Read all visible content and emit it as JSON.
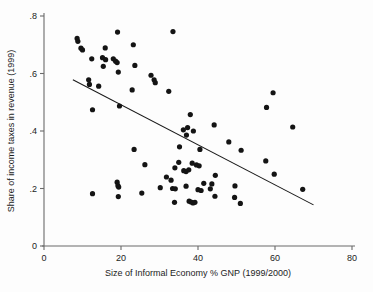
{
  "chart_data": {
    "type": "scatter",
    "title": "",
    "xlabel": "Size of Informal Economy % GNP (1999/2000)",
    "ylabel": "Share of income taxes in revenue (1999)",
    "xlim": [
      0,
      80
    ],
    "ylim": [
      0,
      0.8
    ],
    "xticks": [
      0,
      20,
      40,
      60,
      80
    ],
    "xticklabels": [
      "0",
      "20",
      "40",
      "60",
      "80"
    ],
    "yticks": [
      0,
      0.2,
      0.4,
      0.6,
      0.8
    ],
    "yticklabels": [
      "0",
      ".2",
      ".4",
      ".6",
      ".8"
    ],
    "grid": false,
    "legend": null,
    "marker": "filled-circle",
    "marker_color": "#141414",
    "axis_color": "#6b6b6b",
    "points": [
      {
        "x": 8.6,
        "y": 0.722
      },
      {
        "x": 8.8,
        "y": 0.712
      },
      {
        "x": 9.6,
        "y": 0.688
      },
      {
        "x": 10.0,
        "y": 0.682
      },
      {
        "x": 12.4,
        "y": 0.651
      },
      {
        "x": 15.9,
        "y": 0.689
      },
      {
        "x": 19.1,
        "y": 0.744
      },
      {
        "x": 15.2,
        "y": 0.655
      },
      {
        "x": 16.0,
        "y": 0.648
      },
      {
        "x": 15.4,
        "y": 0.625
      },
      {
        "x": 18.0,
        "y": 0.651
      },
      {
        "x": 18.6,
        "y": 0.643
      },
      {
        "x": 19.0,
        "y": 0.638
      },
      {
        "x": 19.3,
        "y": 0.605
      },
      {
        "x": 23.2,
        "y": 0.7
      },
      {
        "x": 23.6,
        "y": 0.628
      },
      {
        "x": 33.5,
        "y": 0.746
      },
      {
        "x": 27.8,
        "y": 0.594
      },
      {
        "x": 28.6,
        "y": 0.578
      },
      {
        "x": 28.9,
        "y": 0.568
      },
      {
        "x": 11.6,
        "y": 0.578
      },
      {
        "x": 11.8,
        "y": 0.562
      },
      {
        "x": 14.2,
        "y": 0.556
      },
      {
        "x": 22.9,
        "y": 0.543
      },
      {
        "x": 32.4,
        "y": 0.538
      },
      {
        "x": 12.6,
        "y": 0.474
      },
      {
        "x": 19.6,
        "y": 0.487
      },
      {
        "x": 57.8,
        "y": 0.482
      },
      {
        "x": 59.5,
        "y": 0.533
      },
      {
        "x": 64.6,
        "y": 0.414
      },
      {
        "x": 38.0,
        "y": 0.457
      },
      {
        "x": 44.2,
        "y": 0.421
      },
      {
        "x": 36.2,
        "y": 0.404
      },
      {
        "x": 37.3,
        "y": 0.412
      },
      {
        "x": 37.0,
        "y": 0.386
      },
      {
        "x": 38.8,
        "y": 0.4
      },
      {
        "x": 35.2,
        "y": 0.345
      },
      {
        "x": 40.5,
        "y": 0.336
      },
      {
        "x": 48.0,
        "y": 0.362
      },
      {
        "x": 51.2,
        "y": 0.333
      },
      {
        "x": 23.4,
        "y": 0.336
      },
      {
        "x": 26.2,
        "y": 0.283
      },
      {
        "x": 57.6,
        "y": 0.296
      },
      {
        "x": 59.8,
        "y": 0.25
      },
      {
        "x": 34.0,
        "y": 0.272
      },
      {
        "x": 35.0,
        "y": 0.291
      },
      {
        "x": 36.3,
        "y": 0.262
      },
      {
        "x": 36.9,
        "y": 0.259
      },
      {
        "x": 37.6,
        "y": 0.265
      },
      {
        "x": 38.5,
        "y": 0.288
      },
      {
        "x": 39.6,
        "y": 0.282
      },
      {
        "x": 40.3,
        "y": 0.279
      },
      {
        "x": 33.0,
        "y": 0.229
      },
      {
        "x": 33.4,
        "y": 0.2
      },
      {
        "x": 34.1,
        "y": 0.199
      },
      {
        "x": 31.8,
        "y": 0.24
      },
      {
        "x": 36.9,
        "y": 0.208
      },
      {
        "x": 40.0,
        "y": 0.196
      },
      {
        "x": 40.8,
        "y": 0.193
      },
      {
        "x": 41.5,
        "y": 0.218
      },
      {
        "x": 44.5,
        "y": 0.246
      },
      {
        "x": 43.6,
        "y": 0.216
      },
      {
        "x": 49.6,
        "y": 0.209
      },
      {
        "x": 19.0,
        "y": 0.222
      },
      {
        "x": 19.2,
        "y": 0.21
      },
      {
        "x": 19.4,
        "y": 0.205
      },
      {
        "x": 12.6,
        "y": 0.182
      },
      {
        "x": 19.3,
        "y": 0.172
      },
      {
        "x": 25.4,
        "y": 0.184
      },
      {
        "x": 33.9,
        "y": 0.152
      },
      {
        "x": 37.7,
        "y": 0.156
      },
      {
        "x": 38.2,
        "y": 0.153
      },
      {
        "x": 38.7,
        "y": 0.15
      },
      {
        "x": 39.2,
        "y": 0.152
      },
      {
        "x": 44.4,
        "y": 0.173
      },
      {
        "x": 49.5,
        "y": 0.169
      },
      {
        "x": 51.0,
        "y": 0.148
      },
      {
        "x": 67.2,
        "y": 0.197
      },
      {
        "x": 30.2,
        "y": 0.203
      },
      {
        "x": 43.2,
        "y": 0.199
      }
    ],
    "fit_line": {
      "x_start": 7.5,
      "y_start": 0.578,
      "x_end": 70.0,
      "y_end": 0.143
    }
  }
}
